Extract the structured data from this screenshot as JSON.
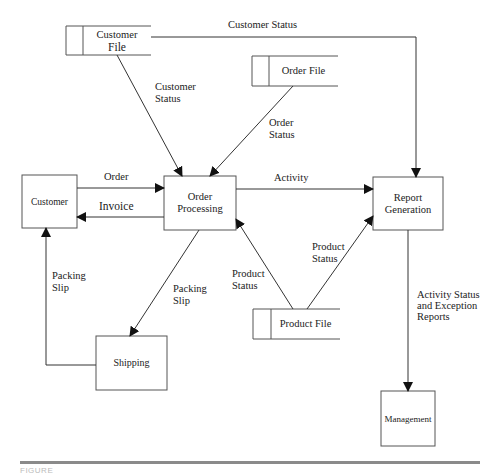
{
  "entities": {
    "customer": "Customer",
    "shipping": "Shipping",
    "management": "Management"
  },
  "processes": {
    "order_processing": [
      "Order",
      "Processing"
    ],
    "report_generation": [
      "Report",
      "Generation"
    ]
  },
  "data_stores": {
    "customer_file": [
      "Customer",
      "File"
    ],
    "order_file": "Order File",
    "product_file": "Product File"
  },
  "flows": {
    "customer_status_top": "Customer Status",
    "customer_status": [
      "Customer",
      "Status"
    ],
    "order_status": [
      "Order",
      "Status"
    ],
    "order": "Order",
    "invoice": "Invoice",
    "activity": "Activity",
    "packing_slip_left": [
      "Packing",
      "Slip"
    ],
    "packing_slip_right": [
      "Packing",
      "Slip"
    ],
    "product_status_left": [
      "Product",
      "Status"
    ],
    "product_status_right": [
      "Product",
      "Status"
    ],
    "activity_status": [
      "Activity Status",
      "and Exception",
      "Reports"
    ]
  },
  "caption": "FIGURE"
}
